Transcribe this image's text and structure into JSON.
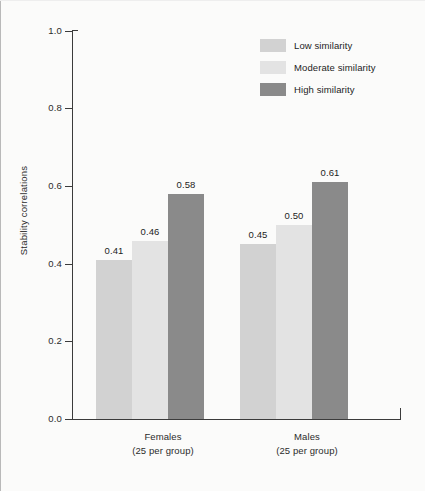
{
  "chart_data": {
    "type": "bar",
    "title": "",
    "xlabel": "",
    "ylabel": "Stability correlations",
    "ylim": [
      0.0,
      1.0
    ],
    "ytick_labels": [
      "0.0",
      "0.2",
      "0.4",
      "0.6",
      "0.8",
      "1.0"
    ],
    "ytick_values": [
      0.0,
      0.2,
      0.4,
      0.6,
      0.8,
      1.0
    ],
    "grid": false,
    "legend_position": "top-right",
    "categories": [
      "Females",
      "Males"
    ],
    "category_sublabels": [
      "(25 per group)",
      "(25 per group)"
    ],
    "series": [
      {
        "name": "Low similarity",
        "color": "#d2d2d2",
        "values": [
          0.41,
          0.45
        ],
        "labels": [
          "0.41",
          "0.45"
        ]
      },
      {
        "name": "Moderate similarity",
        "color": "#e3e3e3",
        "values": [
          0.46,
          0.5
        ],
        "labels": [
          "0.46",
          "0.50"
        ]
      },
      {
        "name": "High similarity",
        "color": "#8a8a8a",
        "values": [
          0.58,
          0.61
        ],
        "labels": [
          "0.58",
          "0.61"
        ]
      }
    ]
  },
  "legend": {
    "items": [
      {
        "label": "Low similarity",
        "color": "#d2d2d2"
      },
      {
        "label": "Moderate similarity",
        "color": "#e3e3e3"
      },
      {
        "label": "High similarity",
        "color": "#8a8a8a"
      }
    ]
  },
  "axis": {
    "y_title": "Stability correlations",
    "y_ticks": [
      "1.0",
      "0.8",
      "0.6",
      "0.4",
      "0.2",
      "0.0"
    ]
  },
  "groups": [
    {
      "name": "Females",
      "sublabel": "(25 per group)",
      "bars": [
        {
          "series": "Low similarity",
          "value_label": "0.41"
        },
        {
          "series": "Moderate similarity",
          "value_label": "0.46"
        },
        {
          "series": "High similarity",
          "value_label": "0.58"
        }
      ]
    },
    {
      "name": "Males",
      "sublabel": "(25 per group)",
      "bars": [
        {
          "series": "Low similarity",
          "value_label": "0.45"
        },
        {
          "series": "Moderate similarity",
          "value_label": "0.50"
        },
        {
          "series": "High similarity",
          "value_label": "0.61"
        }
      ]
    }
  ]
}
